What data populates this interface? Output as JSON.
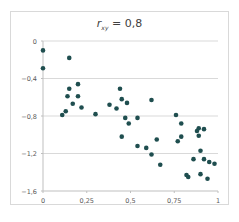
{
  "chart_data": {
    "type": "scatter",
    "title_parts": {
      "var": "r",
      "sub": "xy",
      "rest": " = 0,8"
    },
    "xlabel": "",
    "ylabel": "",
    "xlim": [
      0,
      1
    ],
    "ylim": [
      -1.6,
      0
    ],
    "x_ticks": [
      "0",
      "0,25",
      "0,5",
      "0,75",
      "1"
    ],
    "y_ticks": [
      "0",
      "-0,4",
      "-0,8",
      "-1,2",
      "-1,6"
    ],
    "grid": "horizontal",
    "legend": "none",
    "marker_color": "#1f4e4f",
    "points": [
      [
        0.0,
        -0.1
      ],
      [
        0.0,
        -0.29
      ],
      [
        0.15,
        -0.18
      ],
      [
        0.15,
        -0.51
      ],
      [
        0.14,
        -0.59
      ],
      [
        0.2,
        -0.46
      ],
      [
        0.2,
        -0.59
      ],
      [
        0.17,
        -0.67
      ],
      [
        0.22,
        -0.71
      ],
      [
        0.13,
        -0.75
      ],
      [
        0.11,
        -0.79
      ],
      [
        0.3,
        -0.78
      ],
      [
        0.38,
        -0.68
      ],
      [
        0.42,
        -0.72
      ],
      [
        0.44,
        -0.51
      ],
      [
        0.45,
        -0.62
      ],
      [
        0.48,
        -0.66
      ],
      [
        0.47,
        -0.82
      ],
      [
        0.49,
        -0.88
      ],
      [
        0.45,
        -1.02
      ],
      [
        0.54,
        -0.82
      ],
      [
        0.62,
        -0.63
      ],
      [
        0.54,
        -1.12
      ],
      [
        0.59,
        -1.14
      ],
      [
        0.62,
        -1.21
      ],
      [
        0.65,
        -1.05
      ],
      [
        0.67,
        -1.32
      ],
      [
        0.76,
        -0.79
      ],
      [
        0.79,
        -0.88
      ],
      [
        0.79,
        -1.02
      ],
      [
        0.77,
        -1.07
      ],
      [
        0.86,
        -1.26
      ],
      [
        0.82,
        -1.43
      ],
      [
        0.83,
        -1.45
      ],
      [
        0.88,
        -0.96
      ],
      [
        0.89,
        -0.93
      ],
      [
        0.92,
        -0.94
      ],
      [
        0.89,
        -1.01
      ],
      [
        0.9,
        -1.17
      ],
      [
        0.92,
        -1.26
      ],
      [
        0.95,
        -1.29
      ],
      [
        0.98,
        -1.31
      ],
      [
        0.9,
        -1.42
      ],
      [
        0.94,
        -1.47
      ]
    ]
  },
  "labels": {
    "title_var": "r",
    "title_sub": "xy",
    "title_rest": " = 0,8",
    "x_ticks": [
      "0",
      "0,25",
      "0,5",
      "0,75",
      "1"
    ],
    "y_ticks": [
      "0",
      "−0,4",
      "−0,8",
      "−1,2",
      "−1,6"
    ]
  }
}
